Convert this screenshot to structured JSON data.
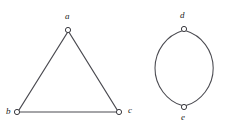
{
  "figure": {
    "background_color": "#ffffff",
    "stroke_color": "#4a4a50",
    "node_fill_color": "#ffffff",
    "node_stroke_color": "#3a3a40",
    "label_color": "#1d1d1d"
  },
  "components": [
    {
      "name": "triangle-component",
      "kind": "cycle",
      "vertex_count": 3,
      "edge_count": 3
    },
    {
      "name": "lens-component",
      "kind": "multi-edge-pair",
      "vertex_count": 2,
      "edge_count": 2
    }
  ],
  "vertices": [
    {
      "id": "a",
      "label": "a",
      "x": 68,
      "y": 30,
      "label_x": 65,
      "label_y": 12,
      "component": "triangle-component"
    },
    {
      "id": "b",
      "label": "b",
      "x": 17,
      "y": 112,
      "label_x": 6,
      "label_y": 107,
      "component": "triangle-component"
    },
    {
      "id": "c",
      "label": "c",
      "x": 119,
      "y": 112,
      "label_x": 128,
      "label_y": 106,
      "component": "triangle-component"
    },
    {
      "id": "d",
      "label": "d",
      "x": 184,
      "y": 29,
      "label_x": 180,
      "label_y": 11,
      "component": "lens-component"
    },
    {
      "id": "e",
      "label": "e",
      "x": 184,
      "y": 107,
      "label_x": 181,
      "label_y": 113,
      "component": "lens-component"
    }
  ],
  "edges": [
    {
      "id": "ab",
      "from": "a",
      "to": "b",
      "type": "straight"
    },
    {
      "id": "ac",
      "from": "a",
      "to": "c",
      "type": "straight"
    },
    {
      "id": "bc",
      "from": "b",
      "to": "c",
      "type": "straight"
    },
    {
      "id": "de-left",
      "from": "d",
      "to": "e",
      "type": "arc",
      "bow": "left"
    },
    {
      "id": "de-right",
      "from": "d",
      "to": "e",
      "type": "arc",
      "bow": "right"
    }
  ],
  "geometry": {
    "triangle_path": "M 68 31.5 L 18.5 110.8 M 68 31.5 L 117.8 110.8 M 19.5 112 L 117 112",
    "arc_left_path": "M 183 30.5 C 166 36 155 52 155 68 C 155 86 168 102.5 182.6 106.2",
    "arc_right_path": "M 185.5 30.5 C 202 36 213 52 213 68 C 213 86 200 102.5 185.6 106.2",
    "node_radius": 2.6,
    "canvas": {
      "width": 225,
      "height": 124
    }
  }
}
